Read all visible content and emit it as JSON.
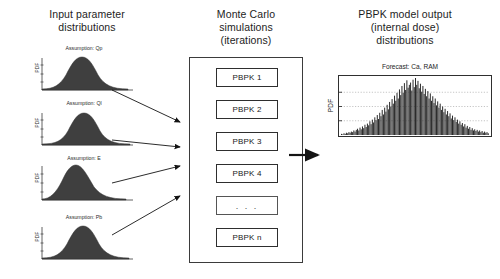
{
  "diagram": {
    "background_color": "#ffffff",
    "ink_color": "#1a1a1a",
    "distribution_fill_color": "#3f3f3f",
    "histogram_color": "#2b2b2b"
  },
  "columns": {
    "left": {
      "heading": "Input parameter\ndistributions",
      "heading_line1": "Input parameter",
      "heading_line2": "distributions",
      "distributions": [
        {
          "label": "Assumption: Qp",
          "ylabel": "PDF",
          "shape": "normal",
          "peak_x": 0.42,
          "width": 0.2
        },
        {
          "label": "Assumption: Ql",
          "ylabel": "PDF",
          "shape": "normal",
          "peak_x": 0.46,
          "width": 0.19
        },
        {
          "label": "Assumption: E",
          "ylabel": "PDF",
          "shape": "normal-skewed",
          "peak_x": 0.38,
          "width": 0.17
        },
        {
          "label": "Assumption: Pb",
          "ylabel": "PDF",
          "shape": "normal",
          "peak_x": 0.44,
          "width": 0.2
        }
      ]
    },
    "middle": {
      "heading_line1": "Monte Carlo",
      "heading_line2": "simulations",
      "heading_line3": "(iterations)",
      "items": [
        {
          "label": "PBPK 1"
        },
        {
          "label": "PBPK 2"
        },
        {
          "label": "PBPK 3"
        },
        {
          "label": "PBPK 4"
        },
        {
          "label": ". . ."
        },
        {
          "label": "PBPK n"
        }
      ]
    },
    "right": {
      "heading_line1": "PBPK model output",
      "heading_line2": "(internal dose)",
      "heading_line3": "distributions",
      "forecast": {
        "title": "Forecast: Ca, RAM",
        "ylabel": "PDF",
        "gridlines": 3
      }
    }
  },
  "chart_data": {
    "type": "histogram",
    "title": "Forecast: Ca, RAM",
    "xlabel": "",
    "ylabel": "PDF",
    "grid": true,
    "gridline_count": 3,
    "bin_values": [
      2,
      1,
      3,
      2,
      4,
      3,
      5,
      4,
      6,
      5,
      8,
      6,
      9,
      11,
      8,
      13,
      10,
      15,
      12,
      18,
      14,
      20,
      17,
      24,
      19,
      27,
      22,
      31,
      26,
      35,
      28,
      39,
      33,
      44,
      36,
      48,
      41,
      53,
      45,
      58,
      50,
      63,
      55,
      69,
      60,
      74,
      64,
      80,
      70,
      86,
      74,
      91,
      79,
      96,
      83,
      88,
      92,
      78,
      97,
      84,
      100,
      88,
      95,
      82,
      90,
      76,
      86,
      72,
      81,
      68,
      77,
      64,
      73,
      60,
      68,
      56,
      64,
      52,
      59,
      48,
      55,
      44,
      50,
      40,
      46,
      36,
      42,
      33,
      38,
      29,
      34,
      26,
      31,
      23,
      27,
      20,
      24,
      18,
      21,
      15,
      19,
      13,
      16,
      11,
      14,
      9,
      12,
      8,
      10,
      7,
      9,
      6,
      8,
      5,
      7,
      4,
      6,
      4,
      5,
      3
    ],
    "ylim": [
      0,
      100
    ],
    "series_name": "Ca, RAM"
  },
  "arrows": {
    "left_to_middle_count": 4,
    "middle_to_right_count": 1,
    "style": "solid-thin-filled-head"
  }
}
